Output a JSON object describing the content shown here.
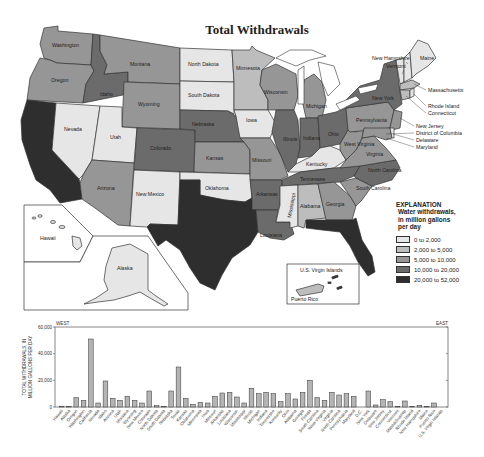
{
  "title": "Total Withdrawals",
  "legend": {
    "heading": "EXPLANATION",
    "subheading": [
      "Water withdrawals,",
      "in million gallons",
      "per day"
    ],
    "classes": [
      {
        "label": "0 to 2,000",
        "color": "#e6e6e6"
      },
      {
        "label": "2,000 to 5,000",
        "color": "#bdbdbd"
      },
      {
        "label": "5,000 to 10,000",
        "color": "#969696"
      },
      {
        "label": "10,000 to 20,000",
        "color": "#6b6b6b"
      },
      {
        "label": "20,000 to 52,000",
        "color": "#2e2e2e"
      }
    ]
  },
  "map": {
    "state_labels": [
      "Washington",
      "Oregon",
      "Idaho",
      "Montana",
      "Wyoming",
      "Nevada",
      "Utah",
      "Colorado",
      "Arizona",
      "New Mexico",
      "North Dakota",
      "South Dakota",
      "Nebraska",
      "Kansas",
      "Oklahoma",
      "Minnesota",
      "Iowa",
      "Missouri",
      "Arkansas",
      "Louisiana",
      "Wisconsin",
      "Illinois",
      "Michigan",
      "Indiana",
      "Ohio",
      "Kentucky",
      "Tennessee",
      "Mississippi",
      "Alabama",
      "Georgia",
      "South Carolina",
      "North Carolina",
      "Virginia",
      "West Virginia",
      "Pennsylvania",
      "New York",
      "Maine",
      "Hawaii",
      "Alaska"
    ],
    "callouts": [
      "New Hampshire",
      "Vermont",
      "Massachusetts",
      "Rhode Island",
      "Connecticut",
      "New Jersey",
      "District of Columbia",
      "Delaware",
      "Maryland"
    ],
    "inset_labels": {
      "hawaii": "Hawaii",
      "alaska": "Alaska",
      "virgin_islands": "U.S. Virgin Islands",
      "puerto_rico": "Puerto Rico"
    }
  },
  "chart_data": {
    "type": "bar",
    "title": "",
    "xlabel": "",
    "ylabel": "TOTAL WITHDRAWALS, IN MILLION GALLONS PER DAY",
    "ylim": [
      0,
      60000
    ],
    "yticks": [
      "0",
      "20,000",
      "40,000",
      "60,000"
    ],
    "annotations": {
      "left": "WEST",
      "right": "EAST"
    },
    "grid": false,
    "categories": [
      "Hawaii",
      "Alaska",
      "Oregon",
      "Washington",
      "California",
      "Nevada",
      "Idaho",
      "Arizona",
      "Utah",
      "Montana",
      "Wyoming",
      "New Mexico",
      "Colorado",
      "North Dakota",
      "South Dakota",
      "Nebraska",
      "Texas",
      "Kansas",
      "Oklahoma",
      "Minnesota",
      "Iowa",
      "Missouri",
      "Arkansas",
      "Louisiana",
      "Wisconsin",
      "Mississippi",
      "Illinois",
      "Michigan",
      "Indiana",
      "Tennessee",
      "Kentucky",
      "Ohio",
      "Alabama",
      "Georgia",
      "Florida",
      "South Carolina",
      "West Virginia",
      "Virginia",
      "North Carolina",
      "Pennsylvania",
      "Maryland",
      "D.C.",
      "New York",
      "Delaware",
      "New Jersey",
      "Connecticut",
      "Vermont",
      "Massachusetts",
      "Rhode Island",
      "New Hampshire",
      "Maine",
      "Puerto Rico",
      "U.S. Virgin Islands"
    ],
    "values": [
      600,
      300,
      7000,
      5000,
      51000,
      3000,
      19500,
      6500,
      5000,
      8000,
      5000,
      3000,
      12000,
      1000,
      500,
      12000,
      30000,
      6500,
      2000,
      3500,
      3000,
      8000,
      10500,
      11000,
      7500,
      3000,
      14000,
      10000,
      11000,
      10000,
      4000,
      10000,
      6000,
      11000,
      20000,
      7000,
      5000,
      11000,
      9000,
      10000,
      8000,
      10,
      12000,
      1500,
      5500,
      4000,
      500,
      4500,
      300,
      1200,
      500,
      3000,
      10
    ]
  }
}
